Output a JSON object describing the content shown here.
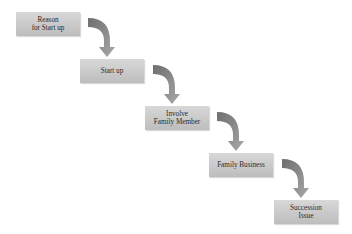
{
  "diagram": {
    "type": "staircase-process-flow",
    "colors": {
      "box_fill": "#c9c9c9",
      "arrow_dark": "#6e6e6e",
      "arrow_light": "#a8a8a8",
      "text": "#2a2a2a",
      "background": "#ffffff"
    },
    "steps": [
      {
        "label": "Reason\nfor Start up"
      },
      {
        "label": "Start up"
      },
      {
        "label": "Involve\nFamily Member"
      },
      {
        "label": "Family Business"
      },
      {
        "label": "Succession\nIssue"
      }
    ],
    "connections": [
      {
        "from": 0,
        "to": 1
      },
      {
        "from": 1,
        "to": 2
      },
      {
        "from": 2,
        "to": 3
      },
      {
        "from": 3,
        "to": 4
      }
    ]
  }
}
